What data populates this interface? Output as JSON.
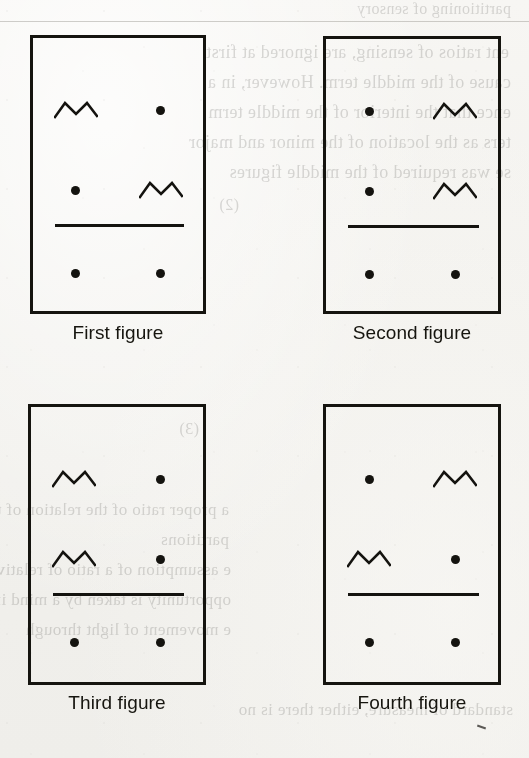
{
  "page": {
    "kind": "scanned-book-figure-page",
    "background_color": "#f3f2ef",
    "ink_color": "#15140f"
  },
  "glyphs": {
    "dot": "dot",
    "zigzag": "zigzag",
    "empty": "empty"
  },
  "figures": [
    {
      "id": "first-figure",
      "caption": "First figure",
      "box": {
        "x": 30,
        "y": 35,
        "w": 176,
        "h": 279
      },
      "caption_y": 322,
      "divider_y": 186,
      "rows": [
        {
          "y": 55,
          "left": "zigzag",
          "right": "dot"
        },
        {
          "y": 135,
          "left": "dot",
          "right": "zigzag"
        },
        {
          "y": 218,
          "left": "dot",
          "right": "dot"
        }
      ]
    },
    {
      "id": "second-figure",
      "caption": "Second figure",
      "box": {
        "x": 323,
        "y": 36,
        "w": 178,
        "h": 278
      },
      "caption_y": 322,
      "divider_y": 186,
      "rows": [
        {
          "y": 55,
          "left": "dot",
          "right": "zigzag"
        },
        {
          "y": 135,
          "left": "dot",
          "right": "zigzag"
        },
        {
          "y": 218,
          "left": "dot",
          "right": "dot"
        }
      ]
    },
    {
      "id": "third-figure",
      "caption": "Third figure",
      "box": {
        "x": 28,
        "y": 404,
        "w": 178,
        "h": 281
      },
      "caption_y": 692,
      "divider_y": 186,
      "rows": [
        {
          "y": 55,
          "left": "zigzag",
          "right": "dot"
        },
        {
          "y": 135,
          "left": "zigzag",
          "right": "dot"
        },
        {
          "y": 218,
          "left": "dot",
          "right": "dot"
        }
      ]
    },
    {
      "id": "fourth-figure",
      "caption": "Fourth figure",
      "box": {
        "x": 323,
        "y": 404,
        "w": 178,
        "h": 281
      },
      "caption_y": 692,
      "divider_y": 186,
      "rows": [
        {
          "y": 55,
          "left": "dot",
          "right": "zigzag"
        },
        {
          "y": 135,
          "left": "zigzag",
          "right": "dot"
        },
        {
          "y": 218,
          "left": "dot",
          "right": "dot"
        }
      ]
    }
  ],
  "show_through_lines": [
    {
      "x": 18,
      "y": 0,
      "text": "partitioning of sensory",
      "size": 16
    },
    {
      "x": 20,
      "y": 42,
      "text": "ent ratios of sensing, are ignored at first",
      "size": 18
    },
    {
      "x": 18,
      "y": 72,
      "text": "cause of the middle term. However, in a",
      "size": 18
    },
    {
      "x": 18,
      "y": 102,
      "text": "ence that the interior of the middle term",
      "size": 18
    },
    {
      "x": 18,
      "y": 132,
      "text": "ters as the location of the minor and major",
      "size": 18
    },
    {
      "x": 18,
      "y": 162,
      "text": "se was required of the middle figures",
      "size": 18
    },
    {
      "x": 290,
      "y": 196,
      "text": "(2)",
      "size": 16
    },
    {
      "x": 330,
      "y": 420,
      "text": "(3)",
      "size": 16
    },
    {
      "x": 300,
      "y": 500,
      "text": "a proper ratio of the relation of the",
      "size": 17
    },
    {
      "x": 300,
      "y": 530,
      "text": "partitions",
      "size": 17
    },
    {
      "x": 298,
      "y": 560,
      "text": "e assumption of a ratio of relative",
      "size": 17
    },
    {
      "x": 298,
      "y": 590,
      "text": "opportunity is taken by a mind in",
      "size": 17
    },
    {
      "x": 298,
      "y": 620,
      "text": "e movement of light through",
      "size": 17
    },
    {
      "x": 16,
      "y": 700,
      "text": "standard of measure, either there is no",
      "size": 17
    }
  ]
}
